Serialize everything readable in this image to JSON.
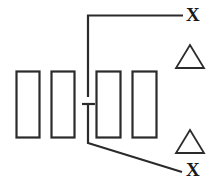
{
  "figure": {
    "background_color": "#ffffff",
    "stroke_color": "#2b2b2b",
    "text_color": "#1a1a1a",
    "width": 216,
    "height": 187,
    "labels": {
      "x_top": "X",
      "x_bottom": "X"
    },
    "rectangles": [
      {
        "name": "rectangle-1",
        "x": 16,
        "y": 71,
        "width": 23,
        "height": 66
      },
      {
        "name": "rectangle-2",
        "x": 51,
        "y": 71,
        "width": 23,
        "height": 66
      },
      {
        "name": "rectangle-3",
        "x": 96,
        "y": 71,
        "width": 24,
        "height": 66
      },
      {
        "name": "rectangle-4",
        "x": 132,
        "y": 71,
        "width": 24,
        "height": 66
      }
    ],
    "triangles": [
      {
        "name": "triangle-upper",
        "apex_x": 190,
        "apex_y": 45,
        "left_x": 176,
        "right_x": 204,
        "base_y": 68
      },
      {
        "name": "triangle-lower",
        "apex_x": 190,
        "apex_y": 130,
        "left_x": 176,
        "right_x": 204,
        "base_y": 153
      }
    ],
    "leader_top": {
      "name": "top-leader-line",
      "points": "88,96 88,15 183,15",
      "description": "vertical riser turning right into the top X label"
    },
    "leader_bottom": {
      "name": "bottom-leader-line",
      "points": "88,104 88,143 182,172",
      "description": "vertical drop turning into a diagonal toward the bottom X label"
    },
    "tick_bar": {
      "name": "tick-cross-bar",
      "x1": 82,
      "x2": 95,
      "y": 104
    }
  }
}
